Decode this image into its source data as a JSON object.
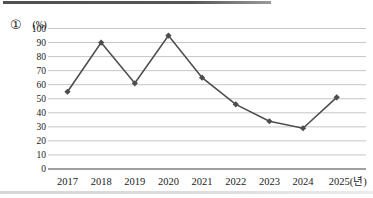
{
  "page": {
    "item_marker": "①"
  },
  "chart_data": {
    "type": "line",
    "title": "",
    "ylabel": "(%)",
    "xlabel_suffix": "(년)",
    "categories": [
      "2017",
      "2018",
      "2019",
      "2020",
      "2021",
      "2022",
      "2023",
      "2024",
      "2025(년)"
    ],
    "values": [
      55,
      90,
      61,
      95,
      65,
      46,
      34,
      29,
      51
    ],
    "ylim": [
      0,
      100
    ],
    "ytick_step": 10,
    "grid": true,
    "legend": "none",
    "line_color": "#4d4d4d",
    "marker": "diamond",
    "grid_color": "#c6c6c6",
    "axis_color": "#7f7f7f",
    "text_color": "#1a1a1a"
  },
  "decorations": {
    "top_rule_color": "#515151",
    "bottom_rule_color": "#d6d6d6"
  }
}
